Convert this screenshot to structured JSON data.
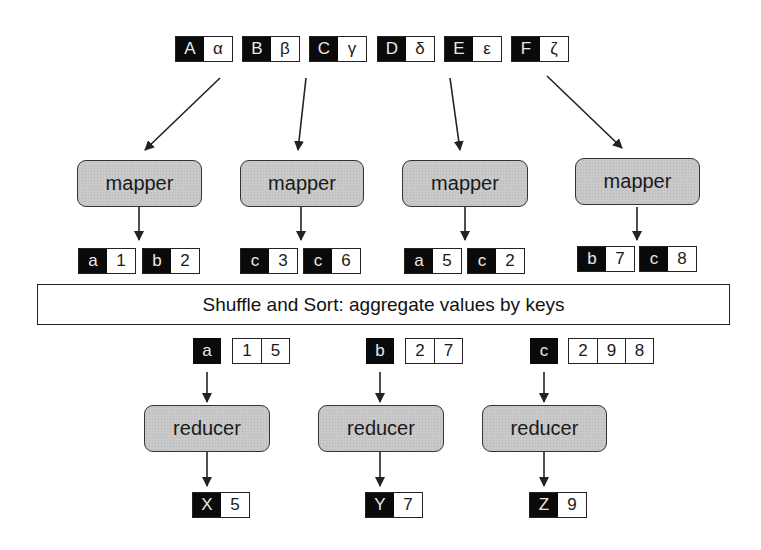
{
  "inputs": [
    {
      "key": "A",
      "value": "α"
    },
    {
      "key": "B",
      "value": "β"
    },
    {
      "key": "C",
      "value": "γ"
    },
    {
      "key": "D",
      "value": "δ"
    },
    {
      "key": "E",
      "value": "ε"
    },
    {
      "key": "F",
      "value": "ζ"
    }
  ],
  "mappers": [
    {
      "label": "mapper",
      "outputs": [
        {
          "key": "a",
          "value": "1"
        },
        {
          "key": "b",
          "value": "2"
        }
      ]
    },
    {
      "label": "mapper",
      "outputs": [
        {
          "key": "c",
          "value": "3"
        },
        {
          "key": "c",
          "value": "6"
        }
      ]
    },
    {
      "label": "mapper",
      "outputs": [
        {
          "key": "a",
          "value": "5"
        },
        {
          "key": "c",
          "value": "2"
        }
      ]
    },
    {
      "label": "mapper",
      "outputs": [
        {
          "key": "b",
          "value": "7"
        },
        {
          "key": "c",
          "value": "8"
        }
      ]
    }
  ],
  "shuffle": {
    "label": "Shuffle and Sort: aggregate values by keys"
  },
  "reducers": [
    {
      "label": "reducer",
      "key": "a",
      "values": [
        "1",
        "5"
      ],
      "output": {
        "key": "X",
        "value": "5"
      }
    },
    {
      "label": "reducer",
      "key": "b",
      "values": [
        "2",
        "7"
      ],
      "output": {
        "key": "Y",
        "value": "7"
      }
    },
    {
      "label": "reducer",
      "key": "c",
      "values": [
        "2",
        "9",
        "8"
      ],
      "output": {
        "key": "Z",
        "value": "9"
      }
    }
  ]
}
